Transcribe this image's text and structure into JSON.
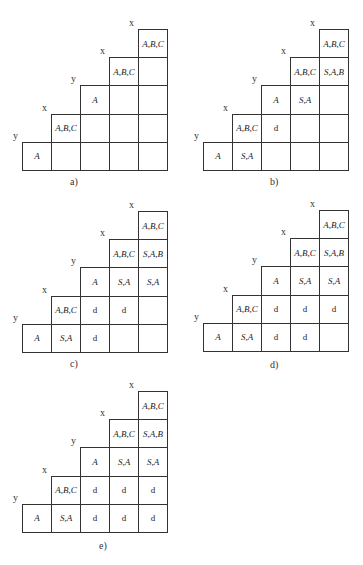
{
  "figure": {
    "panels": [
      {
        "caption": "a)",
        "symbols": [
          "x",
          "x",
          "y",
          "x",
          "y"
        ],
        "rows": [
          [
            "A,B,C"
          ],
          [
            "A,B,C",
            ""
          ],
          [
            "A",
            "",
            ""
          ],
          [
            "A,B,C",
            "",
            "",
            ""
          ],
          [
            "A",
            "",
            "",
            "",
            ""
          ]
        ]
      },
      {
        "caption": "b)",
        "symbols": [
          "x",
          "x",
          "y",
          "x",
          "y"
        ],
        "rows": [
          [
            "A,B,C"
          ],
          [
            "A,B,C",
            "S,A,B"
          ],
          [
            "A",
            "S,A",
            ""
          ],
          [
            "A,B,C",
            "d",
            "",
            ""
          ],
          [
            "A",
            "S,A",
            "",
            "",
            ""
          ]
        ]
      },
      {
        "caption": "c)",
        "symbols": [
          "x",
          "x",
          "y",
          "x",
          "y"
        ],
        "rows": [
          [
            "A,B,C"
          ],
          [
            "A,B,C",
            "S,A,B"
          ],
          [
            "A",
            "S,A",
            "S,A"
          ],
          [
            "A,B,C",
            "d",
            "d",
            ""
          ],
          [
            "A",
            "S,A",
            "d",
            "",
            ""
          ]
        ]
      },
      {
        "caption": "d)",
        "symbols": [
          "x",
          "x",
          "y",
          "x",
          "y"
        ],
        "rows": [
          [
            "A,B,C"
          ],
          [
            "A,B,C",
            "S,A,B"
          ],
          [
            "A",
            "S,A",
            "S,A"
          ],
          [
            "A,B,C",
            "d",
            "d",
            "d"
          ],
          [
            "A",
            "S,A",
            "d",
            "d",
            ""
          ]
        ]
      },
      {
        "caption": "e)",
        "symbols": [
          "x",
          "x",
          "y",
          "x",
          "y"
        ],
        "rows": [
          [
            "A,B,C"
          ],
          [
            "A,B,C",
            "S,A,B"
          ],
          [
            "A",
            "S,A",
            "S,A"
          ],
          [
            "A,B,C",
            "d",
            "d",
            "d"
          ],
          [
            "A",
            "S,A",
            "d",
            "d",
            "d"
          ]
        ]
      }
    ]
  }
}
